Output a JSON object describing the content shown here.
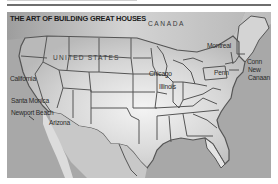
{
  "title": "THE ART OF BUILDING GREAT HOUSES",
  "countries": {
    "canada": "CANADA",
    "usa": "UNITED STATES"
  },
  "locations": [
    {
      "id": "california",
      "label": "California"
    },
    {
      "id": "santa-monica",
      "label": "Santa Monica"
    },
    {
      "id": "newport-beach",
      "label": "Newport Beach"
    },
    {
      "id": "arizona",
      "label": "Arizona"
    },
    {
      "id": "chicago",
      "label": "Chicago"
    },
    {
      "id": "illinois",
      "label": "Illinois"
    },
    {
      "id": "montreal",
      "label": "Montreal"
    },
    {
      "id": "penn",
      "label": "Penn"
    },
    {
      "id": "conn",
      "label": "Conn"
    },
    {
      "id": "new-canaan-line1",
      "label": "New"
    },
    {
      "id": "new-canaan-line2",
      "label": "Canaan"
    }
  ],
  "colors": {
    "land": "#d8d8d8",
    "land_highlight": "#f2f2f2",
    "water": "#a9a9a9",
    "borders": "#555555",
    "text": "#2a2a2a"
  }
}
